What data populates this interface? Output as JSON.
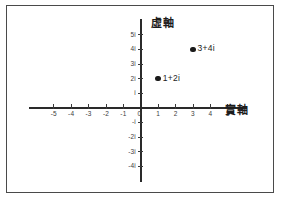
{
  "chart_data": {
    "type": "scatter",
    "title": "",
    "xlabel": "實軸",
    "ylabel": "虛軸",
    "xlim": [
      -6,
      6
    ],
    "ylim": [
      -5,
      6
    ],
    "grid": false,
    "legend": "none",
    "origin_label": "0",
    "x_ticks": [
      {
        "value": -5,
        "label": "-5"
      },
      {
        "value": -4,
        "label": "-4"
      },
      {
        "value": -3,
        "label": "-3"
      },
      {
        "value": -2,
        "label": "-2"
      },
      {
        "value": -1,
        "label": "-1"
      },
      {
        "value": 1,
        "label": "1"
      },
      {
        "value": 2,
        "label": "2"
      },
      {
        "value": 3,
        "label": "3"
      },
      {
        "value": 4,
        "label": "4"
      },
      {
        "value": 5,
        "label": "5"
      }
    ],
    "y_ticks": [
      {
        "value": 5,
        "label": "5i"
      },
      {
        "value": 4,
        "label": "4i"
      },
      {
        "value": 3,
        "label": "3i"
      },
      {
        "value": 2,
        "label": "2i"
      },
      {
        "value": 1,
        "label": "i"
      },
      {
        "value": -1,
        "label": "-i"
      },
      {
        "value": -2,
        "label": "-2i"
      },
      {
        "value": -3,
        "label": "-3i"
      },
      {
        "value": -4,
        "label": "-4i"
      }
    ],
    "points": [
      {
        "x": 3,
        "y": 4,
        "label": "3+4i"
      },
      {
        "x": 1,
        "y": 2,
        "label": "1+2i"
      }
    ],
    "colors": {
      "axis": "#2a2a2a",
      "point": "#1a1a1a",
      "text": "#1c1c1c",
      "frame": "#4a4a4a",
      "background": "#ffffff"
    }
  }
}
